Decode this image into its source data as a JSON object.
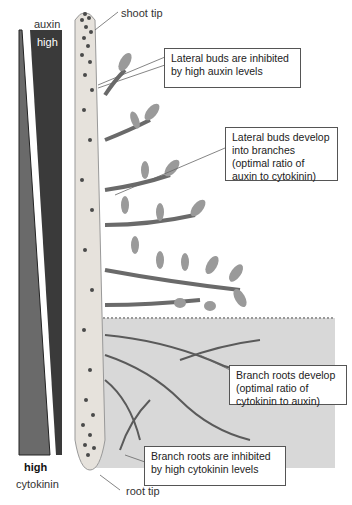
{
  "diagram": {
    "gradient": {
      "auxin": {
        "label": "auxin",
        "level_label": "high",
        "color": "#3a3a3a"
      },
      "cytokinin": {
        "label": "cytokinin",
        "level_label": "high",
        "color": "#6a6a6a"
      }
    },
    "labels": {
      "shoot_tip": "shoot tip",
      "root_tip": "root tip"
    },
    "callouts": [
      {
        "text": "Lateral buds are inhibited by high auxin levels"
      },
      {
        "text": "Lateral buds develop into branches (optimal ratio of auxin to cytokinin)"
      },
      {
        "text": "Branch roots develop (optimal ratio of cytokinin to auxin)"
      },
      {
        "text": "Branch roots are inhibited by high cytokinin levels"
      }
    ],
    "colors": {
      "soil": "#d8d8d8",
      "stem": "#e6e2dc",
      "leaf": "#9a9a9a",
      "dots": "#4a4a4a"
    }
  }
}
